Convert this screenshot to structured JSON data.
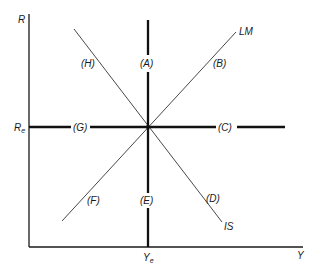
{
  "diagram": {
    "type": "IS-LM regions",
    "axes": {
      "y_label": "R",
      "x_label": "Y",
      "r_equilibrium": "R",
      "r_equilibrium_sub": "e",
      "y_equilibrium": "Y",
      "y_equilibrium_sub": "e"
    },
    "curves": {
      "lm": "LM",
      "is": "IS"
    },
    "regions": {
      "a": "(A)",
      "b": "(B)",
      "c": "(C)",
      "d": "(D)",
      "e": "(E)",
      "f": "(F)",
      "g": "(G)",
      "h": "(H)"
    },
    "colors": {
      "line": "#1a1a1a",
      "background": "#ffffff"
    }
  }
}
